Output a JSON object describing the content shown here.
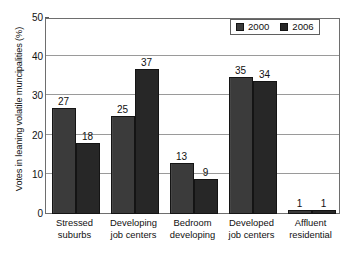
{
  "chart_data": {
    "type": "bar",
    "title": "",
    "subtitle": "",
    "xlabel": "",
    "ylabel": "Votes in leaning volatile muncipalities (%)",
    "ylim": [
      0,
      50
    ],
    "yticks": [
      0,
      10,
      20,
      30,
      40,
      50
    ],
    "ytick_labels": [
      "0",
      "10",
      "20",
      "30",
      "40",
      "50"
    ],
    "grid": "horizontal",
    "legend_position": "top-right",
    "categories": [
      "Stressed suburbs",
      "Developing job centers",
      "Bedroom developing",
      "Developed job centers",
      "Affluent residential"
    ],
    "category_lines": [
      [
        "Stressed",
        "suburbs"
      ],
      [
        "Developing",
        "job centers"
      ],
      [
        "Bedroom",
        "developing"
      ],
      [
        "Developed",
        "job centers"
      ],
      [
        "Affluent",
        "residential"
      ]
    ],
    "series": [
      {
        "name": "2000",
        "color": "#3b3b3b",
        "values": [
          27,
          25,
          13,
          35,
          1
        ],
        "labels": [
          "27",
          "25",
          "13",
          "35",
          "1"
        ]
      },
      {
        "name": "2006",
        "color": "#272727",
        "values": [
          18,
          37,
          9,
          34,
          1
        ],
        "labels": [
          "18",
          "37",
          "9",
          "34",
          "1"
        ]
      }
    ]
  },
  "legend": {
    "entries": [
      {
        "label": "2000"
      },
      {
        "label": "2006"
      }
    ]
  },
  "colors": {
    "series_2000": "#3b3b3b",
    "series_2006": "#272727",
    "gridline": "#9a9a9a",
    "frame": "#6e6e6e",
    "text": "#111111",
    "background": "#ffffff"
  }
}
